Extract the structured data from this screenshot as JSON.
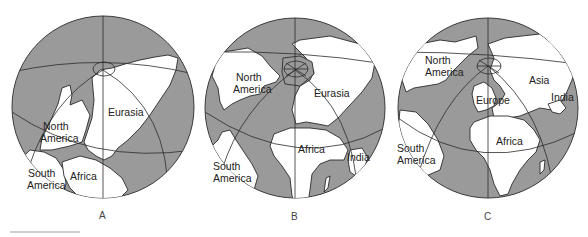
{
  "figure": {
    "colors": {
      "ocean": "#9a9a9a",
      "land": "#ffffff",
      "lines": "#2b2b2b"
    },
    "panels": [
      {
        "id": "A",
        "caption": "A",
        "labels": {
          "eurasia": "Eurasia",
          "north_america_1": "North",
          "north_america_2": "America",
          "south_america_1": "South",
          "south_america_2": "America",
          "africa": "Africa"
        }
      },
      {
        "id": "B",
        "caption": "B",
        "labels": {
          "north_america_1": "North",
          "north_america_2": "America",
          "eurasia": "Eurasia",
          "africa": "Africa",
          "india": "India",
          "south_america_1": "South",
          "south_america_2": "America"
        }
      },
      {
        "id": "C",
        "caption": "C",
        "labels": {
          "north_america_1": "North",
          "north_america_2": "America",
          "asia": "Asia",
          "india": "India",
          "europe": "Europe",
          "africa": "Africa",
          "south_america_1": "South",
          "south_america_2": "America"
        }
      }
    ]
  }
}
